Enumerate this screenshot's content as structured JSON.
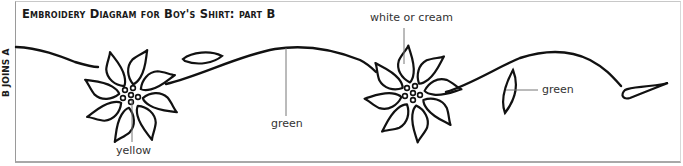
{
  "title": "Embroidery Diagram for Boy's Shirt: part B",
  "side_label": "B JOINS A",
  "labels": {
    "flower1_center": "yellow",
    "vine_middle": "green",
    "flower2_petals": "white or cream",
    "leaf_right": "green"
  },
  "colors": {
    "stroke": "#111111",
    "leader_line": "#777777",
    "frame": "#9a9a9a"
  }
}
